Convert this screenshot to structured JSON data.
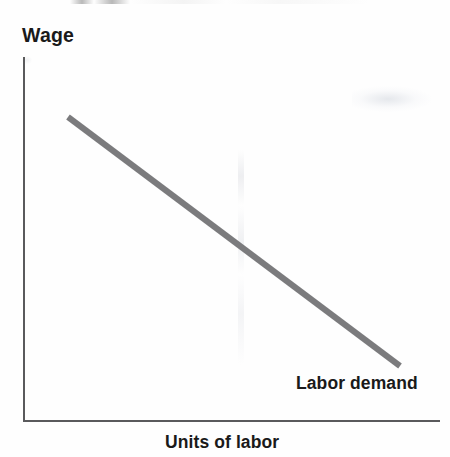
{
  "figure": {
    "background_color": "#fefefe",
    "width": 450,
    "height": 457
  },
  "axes": {
    "y_axis_label": "Wage",
    "x_axis_label": "Units of labor",
    "axis_color": "#5a5a5c",
    "show_ticks": false,
    "show_tick_labels": false,
    "show_grid": false
  },
  "curve": {
    "label": "Labor demand",
    "color": "#7b7b7d",
    "thickness_px": 6
  },
  "chart_data": {
    "type": "line",
    "title": "",
    "subtitle": "",
    "xlabel": "Units of labor",
    "ylabel": "Wage",
    "xlim": [
      0,
      1
    ],
    "ylim": [
      0,
      1
    ],
    "grid": false,
    "legend": false,
    "axis_ticks": "none",
    "series": [
      {
        "name": "Labor demand",
        "color": "#7b7b7d",
        "annotation": "Labor demand",
        "annotation_position": "bottom-right",
        "x": [
          0.108,
          1.0
        ],
        "y": [
          0.835,
          0.149
        ],
        "pixel_points": [
          [
            68,
            117
          ],
          [
            400,
            366
          ]
        ],
        "description": "Downward-sloping straight labor demand curve: wage falls as units of labor increase."
      }
    ],
    "annotations": [
      {
        "text": "Labor demand",
        "x_px": 296,
        "y_px": 373
      }
    ]
  }
}
